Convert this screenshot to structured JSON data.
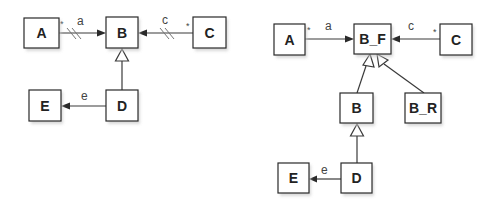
{
  "diagrams": [
    {
      "name": "left",
      "classes": [
        {
          "id": "A",
          "label": "A",
          "x": 24,
          "y": 18,
          "w": 35,
          "h": 30
        },
        {
          "id": "B",
          "label": "B",
          "x": 106,
          "y": 17,
          "w": 32,
          "h": 31
        },
        {
          "id": "C",
          "label": "C",
          "x": 193,
          "y": 17,
          "w": 33,
          "h": 31
        },
        {
          "id": "E",
          "label": "E",
          "x": 29,
          "y": 90,
          "w": 32,
          "h": 31
        },
        {
          "id": "D",
          "label": "D",
          "x": 106,
          "y": 90,
          "w": 32,
          "h": 31
        }
      ],
      "associations": [
        {
          "from": "A",
          "to": "B",
          "label": "a",
          "multiplicity": "*",
          "hashed": true
        },
        {
          "from": "C",
          "to": "B",
          "label": "c",
          "multiplicity": "*",
          "hashed": true
        },
        {
          "from": "D",
          "to": "E",
          "label": "e",
          "multiplicity": "",
          "hashed": false
        }
      ],
      "generalizations": [
        {
          "child": "D",
          "parent": "B"
        }
      ]
    },
    {
      "name": "right",
      "classes": [
        {
          "id": "A",
          "label": "A",
          "x": 274,
          "y": 24,
          "w": 31,
          "h": 31
        },
        {
          "id": "B_F",
          "label": "B_F",
          "x": 354,
          "y": 24,
          "w": 37,
          "h": 30
        },
        {
          "id": "C",
          "label": "C",
          "x": 440,
          "y": 24,
          "w": 32,
          "h": 31
        },
        {
          "id": "B",
          "label": "B",
          "x": 340,
          "y": 93,
          "w": 33,
          "h": 30
        },
        {
          "id": "B_R",
          "label": "B_R",
          "x": 405,
          "y": 93,
          "w": 36,
          "h": 30
        },
        {
          "id": "E",
          "label": "E",
          "x": 278,
          "y": 163,
          "w": 31,
          "h": 30
        },
        {
          "id": "D",
          "label": "D",
          "x": 341,
          "y": 163,
          "w": 31,
          "h": 30
        }
      ],
      "associations": [
        {
          "from": "A",
          "to": "B_F",
          "label": "a",
          "multiplicity": "*",
          "hashed": false
        },
        {
          "from": "C",
          "to": "B_F",
          "label": "c",
          "multiplicity": "*",
          "hashed": false
        },
        {
          "from": "D",
          "to": "E",
          "label": "e",
          "multiplicity": "",
          "hashed": false
        }
      ],
      "generalizations": [
        {
          "child": "B",
          "parent": "B_F"
        },
        {
          "child": "B_R",
          "parent": "B_F"
        },
        {
          "child": "D",
          "parent": "B"
        }
      ]
    }
  ],
  "labels": {
    "left_A": "A",
    "left_B": "B",
    "left_C": "C",
    "left_D": "D",
    "left_E": "E",
    "left_a": "a",
    "left_c": "c",
    "left_e": "e",
    "left_mult_a": "*",
    "left_mult_c": "*",
    "right_A": "A",
    "right_BF": "B_F",
    "right_C": "C",
    "right_B": "B",
    "right_BR": "B_R",
    "right_D": "D",
    "right_E": "E",
    "right_a": "a",
    "right_c": "c",
    "right_e": "e",
    "right_mult_a": "*",
    "right_mult_c": "*"
  }
}
